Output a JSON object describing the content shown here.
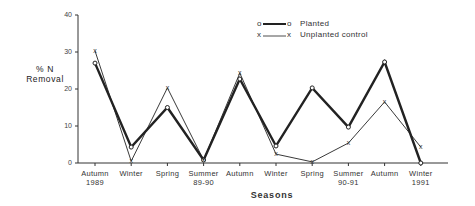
{
  "chart_data": {
    "type": "line",
    "title": "",
    "xlabel": "Seasons",
    "ylabel": "% N Removal",
    "ylim": [
      0,
      40
    ],
    "yticks": [
      0,
      10,
      20,
      30,
      40
    ],
    "grid": false,
    "legend_position": "top-right",
    "categories": [
      "Autumn 1989",
      "Winter",
      "Spring",
      "Summer 89-90",
      "Autumn",
      "Winter",
      "Spring",
      "Summer 90-91",
      "Autumn",
      "Winter 1991"
    ],
    "category_lines": [
      [
        "Autumn",
        "1989"
      ],
      [
        "Winter"
      ],
      [
        "Spring"
      ],
      [
        "Summer",
        "89-90"
      ],
      [
        "Autumn"
      ],
      [
        "Winter"
      ],
      [
        "Spring"
      ],
      [
        "Summer",
        "90-91"
      ],
      [
        "Autumn"
      ],
      [
        "Winter",
        "1991"
      ]
    ],
    "series": [
      {
        "name": "Planted",
        "marker": "o",
        "style": "thick",
        "values": [
          27,
          4.3,
          15,
          0.8,
          22.7,
          4.6,
          20.3,
          9.7,
          27.3,
          0
        ]
      },
      {
        "name": "Unplanted control",
        "marker": "x",
        "style": "thin",
        "values": [
          30.3,
          0.5,
          20.3,
          0.8,
          24.3,
          2.4,
          0.3,
          5.4,
          16.5,
          4.3
        ]
      }
    ]
  },
  "labels": {
    "ylabel_line1": "% N",
    "ylabel_line2": "Removal",
    "xlabel": "Seasons",
    "legend_planted": "Planted",
    "legend_unplanted": "Unplanted control"
  }
}
